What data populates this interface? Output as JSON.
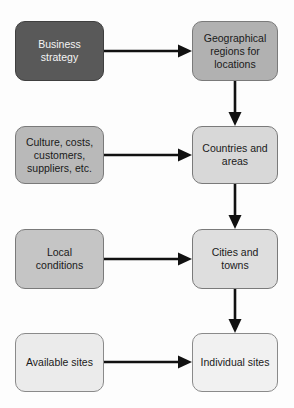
{
  "diagram": {
    "background": "#fdfdfd",
    "arrow_color": "#111111",
    "nodes": [
      {
        "id": "business-strategy",
        "label": "Business\nstrategy",
        "fill": "#595959",
        "border": "#3f3f3f",
        "text_color": "#f5f5f5"
      },
      {
        "id": "geographical-regions",
        "label": "Geographical\nregions for\nlocations",
        "fill": "#b1b1b1",
        "border": "#7a7a7a",
        "text_color": "#1a1a1a"
      },
      {
        "id": "culture-costs",
        "label": "Culture, costs,\ncustomers,\nsuppliers, etc.",
        "fill": "#b9b9b9",
        "border": "#7a7a7a",
        "text_color": "#1a1a1a"
      },
      {
        "id": "countries-areas",
        "label": "Countries and\nareas",
        "fill": "#d8d8d8",
        "border": "#7a7a7a",
        "text_color": "#1a1a1a"
      },
      {
        "id": "local-conditions",
        "label": "Local\nconditions",
        "fill": "#c5c5c5",
        "border": "#7a7a7a",
        "text_color": "#1a1a1a"
      },
      {
        "id": "cities-towns",
        "label": "Cities and\ntowns",
        "fill": "#dedede",
        "border": "#7a7a7a",
        "text_color": "#1a1a1a"
      },
      {
        "id": "available-sites",
        "label": "Available sites",
        "fill": "#ebebeb",
        "border": "#8a8a8a",
        "text_color": "#1a1a1a"
      },
      {
        "id": "individual-sites",
        "label": "Individual sites",
        "fill": "#f1f1f1",
        "border": "#8a8a8a",
        "text_color": "#1a1a1a"
      }
    ],
    "arrows": [
      {
        "from": "business-strategy",
        "to": "geographical-regions",
        "direction": "right"
      },
      {
        "from": "culture-costs",
        "to": "countries-areas",
        "direction": "right"
      },
      {
        "from": "local-conditions",
        "to": "cities-towns",
        "direction": "right"
      },
      {
        "from": "available-sites",
        "to": "individual-sites",
        "direction": "right"
      },
      {
        "from": "geographical-regions",
        "to": "countries-areas",
        "direction": "down"
      },
      {
        "from": "countries-areas",
        "to": "cities-towns",
        "direction": "down"
      },
      {
        "from": "cities-towns",
        "to": "individual-sites",
        "direction": "down"
      }
    ]
  }
}
